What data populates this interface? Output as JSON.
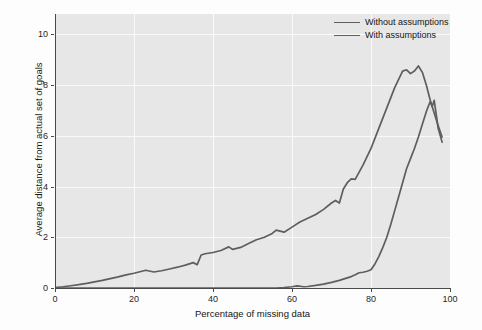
{
  "chart_data": {
    "type": "line",
    "title": "",
    "xlabel": "Percentage of missing data",
    "ylabel": "Average distance from actual set of goals",
    "xlim": [
      0,
      100
    ],
    "ylim": [
      0,
      10.8
    ],
    "xticks": [
      0,
      20,
      40,
      60,
      80,
      100
    ],
    "yticks": [
      0,
      2,
      4,
      6,
      8,
      10
    ],
    "grid": true,
    "legend_position": "top-right",
    "background": "#e7e7e7",
    "gridline_color": "#fafafa",
    "line_color": "#5e5e5e",
    "series": [
      {
        "name": "Without assumptions",
        "x": [
          0,
          2,
          4,
          6,
          8,
          10,
          12,
          14,
          16,
          18,
          20,
          22,
          23,
          25,
          27,
          29,
          31,
          33,
          35,
          36,
          37,
          38,
          40,
          42,
          44,
          45,
          47,
          49,
          51,
          53,
          55,
          56,
          58,
          60,
          62,
          64,
          66,
          68,
          70,
          71,
          72,
          73,
          74,
          75,
          76,
          78,
          80,
          82,
          84,
          86,
          88,
          89,
          90,
          91,
          92,
          93,
          94,
          95,
          96,
          97,
          98
        ],
        "y": [
          0.02,
          0.05,
          0.09,
          0.13,
          0.18,
          0.24,
          0.3,
          0.37,
          0.44,
          0.52,
          0.58,
          0.66,
          0.7,
          0.63,
          0.68,
          0.75,
          0.82,
          0.9,
          1.0,
          0.92,
          1.3,
          1.35,
          1.4,
          1.48,
          1.62,
          1.52,
          1.6,
          1.75,
          1.9,
          2.0,
          2.15,
          2.28,
          2.2,
          2.4,
          2.6,
          2.75,
          2.9,
          3.1,
          3.35,
          3.45,
          3.35,
          3.9,
          4.15,
          4.3,
          4.28,
          4.85,
          5.5,
          6.3,
          7.1,
          7.9,
          8.55,
          8.6,
          8.45,
          8.55,
          8.75,
          8.5,
          8.0,
          7.4,
          6.9,
          6.4,
          5.95
        ]
      },
      {
        "name": "With assumptions",
        "x": [
          0,
          10,
          20,
          30,
          40,
          50,
          56,
          58,
          60,
          61,
          62,
          63,
          64,
          66,
          68,
          70,
          72,
          74,
          75,
          76,
          77,
          78,
          79,
          80,
          81,
          82,
          83,
          84,
          85,
          86,
          87,
          88,
          89,
          90,
          91,
          92,
          93,
          94,
          95,
          95.5,
          96,
          96.5,
          97,
          98
        ],
        "y": [
          0.0,
          0.0,
          0.0,
          0.0,
          0.0,
          0.0,
          0.0,
          0.02,
          0.05,
          0.08,
          0.07,
          0.05,
          0.06,
          0.1,
          0.15,
          0.22,
          0.3,
          0.4,
          0.45,
          0.52,
          0.6,
          0.62,
          0.66,
          0.72,
          0.95,
          1.25,
          1.6,
          2.0,
          2.5,
          3.05,
          3.6,
          4.15,
          4.7,
          5.1,
          5.5,
          5.95,
          6.45,
          6.95,
          7.35,
          7.15,
          7.4,
          6.85,
          6.3,
          5.75
        ]
      }
    ]
  },
  "legend": {
    "items": [
      {
        "label": "Without assumptions"
      },
      {
        "label": "With assumptions"
      }
    ]
  },
  "axes": {
    "x_title": "Percentage of missing data",
    "y_title": "Average distance from actual set of goals",
    "x_tick_labels": [
      "0",
      "20",
      "40",
      "60",
      "80",
      "100"
    ],
    "y_tick_labels": [
      "0",
      "2",
      "4",
      "6",
      "8",
      "10"
    ]
  }
}
